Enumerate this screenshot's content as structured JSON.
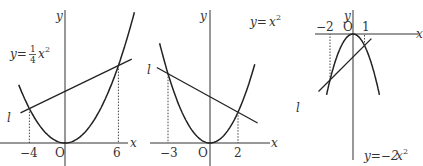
{
  "diagrams": [
    {
      "id": "graph-1",
      "curve_label": {
        "prefix": "y=",
        "frac_num": "1",
        "frac_den": "4",
        "var": "x",
        "exp": "2"
      },
      "curve": {
        "a": 0.25
      },
      "line_label": "l",
      "intersections": [
        {
          "x": -4,
          "y": 4
        },
        {
          "x": 6,
          "y": 9
        }
      ],
      "x_ticks": [
        "−4",
        "6"
      ],
      "origin_label": "O",
      "x_axis_label": "x",
      "y_axis_label": "y",
      "x_range": [
        -5.2,
        7.8
      ]
    },
    {
      "id": "graph-2",
      "curve_label": {
        "prefix": "y=",
        "var": "x",
        "exp": "2"
      },
      "curve": {
        "a": 1
      },
      "line_label": "l",
      "intersections": [
        {
          "x": -3,
          "y": 9
        },
        {
          "x": 2,
          "y": 4
        }
      ],
      "x_ticks": [
        "−3",
        "2"
      ],
      "origin_label": "O",
      "x_axis_label": "x",
      "y_axis_label": "y",
      "x_range": [
        -3.6,
        3.2
      ]
    },
    {
      "id": "graph-3",
      "curve_label": {
        "prefix": "y=−2",
        "var": "x",
        "exp": "2"
      },
      "curve": {
        "a": -2
      },
      "line_label": "l",
      "intersections": [
        {
          "x": -2,
          "y": -8
        },
        {
          "x": 1,
          "y": -2
        }
      ],
      "x_ticks": [
        "−2",
        "1"
      ],
      "origin_label": "O",
      "x_axis_label": "x",
      "y_axis_label": "y",
      "x_range": [
        -2.3,
        2.3
      ]
    }
  ]
}
